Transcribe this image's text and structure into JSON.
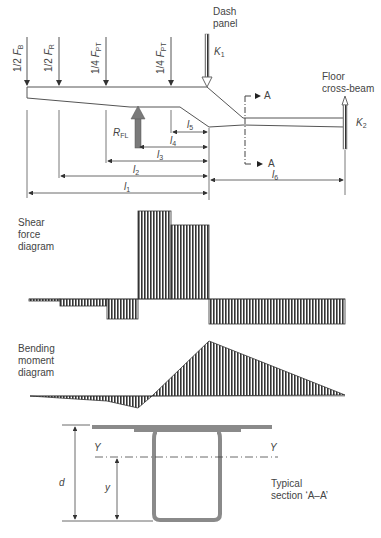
{
  "loads": {
    "f1": {
      "frac": "1/2",
      "sym": "F",
      "sub": "B"
    },
    "f2": {
      "frac": "1/2",
      "sym": "F",
      "sub": "R"
    },
    "f3": {
      "frac": "1/4",
      "sym": "F",
      "sub": "PT"
    },
    "f4": {
      "frac": "1/4",
      "sym": "F",
      "sub": "PT"
    }
  },
  "dash_panel": {
    "line1": "Dash",
    "line2": "panel",
    "k_sym": "K",
    "k_sub": "1"
  },
  "floor_beam": {
    "line1": "Floor",
    "line2": "cross-beam",
    "k_sym": "K",
    "k_sub": "2"
  },
  "reaction": {
    "sym": "R",
    "sub": "FL"
  },
  "section_marker": {
    "top": "A",
    "bottom": "A"
  },
  "dimensions": {
    "l1": {
      "sym": "l",
      "sub": "1"
    },
    "l2": {
      "sym": "l",
      "sub": "2"
    },
    "l3": {
      "sym": "l",
      "sub": "3"
    },
    "l4": {
      "sym": "l",
      "sub": "4"
    },
    "l5": {
      "sym": "l",
      "sub": "5"
    },
    "l6": {
      "sym": "l",
      "sub": "6"
    }
  },
  "shear": {
    "line1": "Shear",
    "line2": "force",
    "line3": "diagram"
  },
  "moment": {
    "line1": "Bending",
    "line2": "moment",
    "line3": "diagram"
  },
  "section": {
    "d": "d",
    "y": "y",
    "axis_left": "Y",
    "axis_right": "Y",
    "caption1": "Typical",
    "caption2": "section ‘A–A’"
  },
  "colors": {
    "line": "#555555",
    "hatch": "#333333",
    "section": "#8a8a8a",
    "arrow": "#7a7a7a"
  }
}
